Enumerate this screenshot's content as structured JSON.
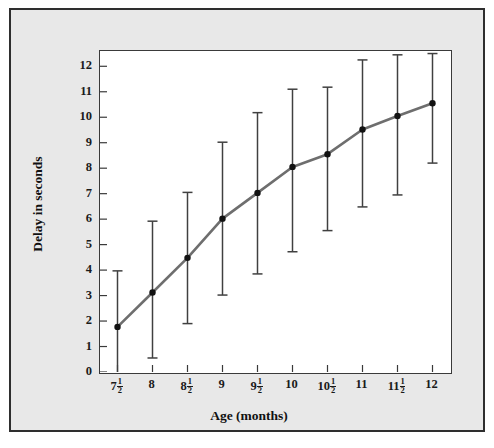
{
  "chart_data": {
    "type": "line",
    "title": "",
    "xlabel": "Age (months)",
    "ylabel": "Delay in seconds",
    "grid": false,
    "legend": null,
    "xlim": [
      7.25,
      12.25
    ],
    "ylim": [
      0,
      12.6
    ],
    "yticks": [
      0,
      1,
      2,
      3,
      4,
      5,
      6,
      7,
      8,
      9,
      10,
      11,
      12
    ],
    "ytick_labels": [
      "0",
      "1",
      "2",
      "3",
      "4",
      "5",
      "6",
      "7",
      "8",
      "9",
      "10",
      "11",
      "12"
    ],
    "xticks": [
      7.5,
      8,
      8.5,
      9,
      9.5,
      10,
      10.5,
      11,
      11.5,
      12
    ],
    "xtick_labels": [
      "7½",
      "8",
      "8½",
      "9",
      "9½",
      "10",
      "10½",
      "11",
      "11½",
      "12"
    ],
    "xtick_parts": [
      {
        "whole": "7",
        "num": "1",
        "den": "2"
      },
      {
        "whole": "8",
        "num": "",
        "den": ""
      },
      {
        "whole": "8",
        "num": "1",
        "den": "2"
      },
      {
        "whole": "9",
        "num": "",
        "den": ""
      },
      {
        "whole": "9",
        "num": "1",
        "den": "2"
      },
      {
        "whole": "10",
        "num": "",
        "den": ""
      },
      {
        "whole": "10",
        "num": "1",
        "den": "2"
      },
      {
        "whole": "11",
        "num": "",
        "den": ""
      },
      {
        "whole": "11",
        "num": "1",
        "den": "2"
      },
      {
        "whole": "12",
        "num": "",
        "den": ""
      }
    ],
    "x": [
      7.5,
      8,
      8.5,
      9,
      9.5,
      10,
      10.5,
      11,
      11.5,
      12
    ],
    "values": [
      1.77,
      3.12,
      4.48,
      6.02,
      7.03,
      8.05,
      8.55,
      9.52,
      10.05,
      10.55
    ],
    "error_upper": [
      3.97,
      5.92,
      7.05,
      9.02,
      10.18,
      11.1,
      11.18,
      12.25,
      12.45,
      12.5
    ],
    "error_lower": [
      -0.2,
      0.55,
      1.9,
      3.02,
      3.85,
      4.72,
      5.55,
      6.48,
      6.95,
      8.2
    ],
    "series": [
      {
        "name": "Delay in seconds",
        "values": [
          1.77,
          3.12,
          4.48,
          6.02,
          7.03,
          8.05,
          8.55,
          9.52,
          10.05,
          10.55
        ]
      }
    ],
    "colors": {
      "line": "#6e6e6e",
      "marker": "#121212",
      "error_bar": "#404040",
      "axis": "#3a3a3a",
      "plot_background": "#ffffff",
      "figure_background": "#e8e8e8",
      "figure_border": "#2e2e2e",
      "text": "#111111"
    },
    "marker": "filled-circle",
    "line_width": 2.6,
    "errorbar_cap": "flat-tee"
  }
}
